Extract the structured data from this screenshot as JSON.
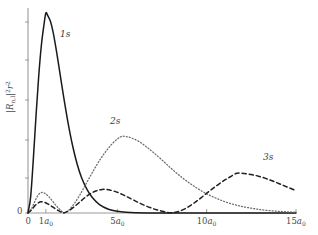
{
  "figure": {
    "title": "",
    "background_color": "#ffffff",
    "axis_color": "#9a9a9a",
    "text_color": "#4a4a4a",
    "width": 318,
    "height": 235
  },
  "axes": {
    "ylabel_parts": {
      "R": "R",
      "nl": "n,l",
      "bars_open": "|",
      "bars_close": "|",
      "sq": "2",
      "r": "r",
      "r_exp": "2"
    },
    "ylabel_text": "|R n,l|² r²",
    "y_origin_label": "0",
    "x_origin_label": "0",
    "xticks": [
      {
        "value": 0,
        "label": "0",
        "unit": "",
        "sub": "",
        "x_px": 28
      },
      {
        "value": 1,
        "label": "1",
        "unit": "a",
        "sub": "0",
        "x_px": 46
      },
      {
        "value": 5,
        "label": "5",
        "unit": "a",
        "sub": "0",
        "x_px": 117
      },
      {
        "value": 10,
        "label": "10",
        "unit": "a",
        "sub": "0",
        "x_px": 206
      },
      {
        "value": 15,
        "label": "15",
        "unit": "a",
        "sub": "0",
        "x_px": 295
      }
    ],
    "yticks_px": [
      22,
      60,
      100,
      140,
      178,
      213
    ],
    "xlim": [
      0,
      15
    ],
    "ylim": [
      0,
      1.0
    ],
    "grid": false
  },
  "chart_data": {
    "type": "line",
    "title": "",
    "xlabel": "",
    "ylabel": "|R_{n,l}|^2 r^2",
    "xlim": [
      0,
      15
    ],
    "ylim": [
      0,
      1.0
    ],
    "x_unit": "a_0",
    "grid": false,
    "legend": "inline-annotations",
    "series": [
      {
        "name": "1s",
        "label": "1s",
        "style": "solid",
        "color": "#1a1a1a",
        "width": 1.5,
        "peak": {
          "x": 1.0,
          "y": 1.0
        },
        "points": [
          [
            0.0,
            0.0
          ],
          [
            0.15,
            0.082
          ],
          [
            0.3,
            0.272
          ],
          [
            0.45,
            0.487
          ],
          [
            0.6,
            0.685
          ],
          [
            0.75,
            0.84
          ],
          [
            0.9,
            0.945
          ],
          [
            1.0,
            1.0
          ],
          [
            1.1,
            0.988
          ],
          [
            1.25,
            0.96
          ],
          [
            1.4,
            0.907
          ],
          [
            1.6,
            0.806
          ],
          [
            1.8,
            0.692
          ],
          [
            2.0,
            0.578
          ],
          [
            2.25,
            0.447
          ],
          [
            2.5,
            0.335
          ],
          [
            2.75,
            0.245
          ],
          [
            3.0,
            0.176
          ],
          [
            3.3,
            0.118
          ],
          [
            3.6,
            0.077
          ],
          [
            4.0,
            0.042
          ],
          [
            4.5,
            0.019
          ],
          [
            5.0,
            0.0084
          ],
          [
            5.5,
            0.0036
          ],
          [
            6.0,
            0.0015
          ],
          [
            7.0,
            0.00025
          ],
          [
            8.0,
            4e-05
          ],
          [
            9.0,
            6e-06
          ],
          [
            10.0,
            1e-06
          ],
          [
            15.0,
            0.0
          ]
        ]
      },
      {
        "name": "2s",
        "label": "2s",
        "style": "dotted",
        "color": "#6e6e6e",
        "width": 1.3,
        "first_bump": {
          "x": 0.78,
          "y": 0.103
        },
        "node": {
          "x": 2.0,
          "y": 0.0
        },
        "peak": {
          "x": 5.24,
          "y": 0.383
        },
        "points": [
          [
            0.0,
            0.0
          ],
          [
            0.2,
            0.022
          ],
          [
            0.4,
            0.062
          ],
          [
            0.6,
            0.093
          ],
          [
            0.78,
            0.103
          ],
          [
            0.95,
            0.098
          ],
          [
            1.15,
            0.083
          ],
          [
            1.35,
            0.062
          ],
          [
            1.55,
            0.04
          ],
          [
            1.75,
            0.02
          ],
          [
            1.9,
            0.008
          ],
          [
            2.0,
            0.0
          ],
          [
            2.15,
            0.005
          ],
          [
            2.35,
            0.02
          ],
          [
            2.6,
            0.048
          ],
          [
            2.9,
            0.09
          ],
          [
            3.2,
            0.138
          ],
          [
            3.5,
            0.186
          ],
          [
            3.8,
            0.233
          ],
          [
            4.1,
            0.276
          ],
          [
            4.4,
            0.313
          ],
          [
            4.7,
            0.345
          ],
          [
            5.0,
            0.37
          ],
          [
            5.24,
            0.383
          ],
          [
            5.5,
            0.382
          ],
          [
            5.8,
            0.375
          ],
          [
            6.2,
            0.358
          ],
          [
            6.6,
            0.333
          ],
          [
            7.0,
            0.304
          ],
          [
            7.5,
            0.265
          ],
          [
            8.0,
            0.224
          ],
          [
            8.5,
            0.186
          ],
          [
            9.0,
            0.152
          ],
          [
            9.5,
            0.122
          ],
          [
            10.0,
            0.096
          ],
          [
            10.5,
            0.075
          ],
          [
            11.0,
            0.057
          ],
          [
            11.5,
            0.043
          ],
          [
            12.0,
            0.032
          ],
          [
            12.5,
            0.024
          ],
          [
            13.0,
            0.017
          ],
          [
            13.5,
            0.012
          ],
          [
            14.0,
            0.0085
          ],
          [
            14.5,
            0.0058
          ],
          [
            15.0,
            0.004
          ]
        ]
      },
      {
        "name": "3s",
        "label": "3s",
        "style": "dashed",
        "color": "#1f1f1f",
        "width": 1.5,
        "first_bump": {
          "x": 0.72,
          "y": 0.056
        },
        "second_bump": {
          "x": 4.15,
          "y": 0.118
        },
        "peak": {
          "x": 11.7,
          "y": 0.199
        },
        "points": [
          [
            0.0,
            0.0
          ],
          [
            0.2,
            0.016
          ],
          [
            0.4,
            0.038
          ],
          [
            0.6,
            0.052
          ],
          [
            0.72,
            0.056
          ],
          [
            0.9,
            0.054
          ],
          [
            1.1,
            0.046
          ],
          [
            1.3,
            0.035
          ],
          [
            1.5,
            0.023
          ],
          [
            1.7,
            0.012
          ],
          [
            1.85,
            0.005
          ],
          [
            1.95,
            0.001
          ],
          [
            2.05,
            0.002
          ],
          [
            2.3,
            0.012
          ],
          [
            2.6,
            0.032
          ],
          [
            2.9,
            0.055
          ],
          [
            3.2,
            0.078
          ],
          [
            3.5,
            0.097
          ],
          [
            3.8,
            0.11
          ],
          [
            4.15,
            0.118
          ],
          [
            4.5,
            0.116
          ],
          [
            4.9,
            0.107
          ],
          [
            5.3,
            0.092
          ],
          [
            5.7,
            0.074
          ],
          [
            6.1,
            0.056
          ],
          [
            6.5,
            0.039
          ],
          [
            6.9,
            0.025
          ],
          [
            7.2,
            0.016
          ],
          [
            7.5,
            0.009
          ],
          [
            7.75,
            0.004
          ],
          [
            7.95,
            0.001
          ],
          [
            8.15,
            0.002
          ],
          [
            8.5,
            0.01
          ],
          [
            8.9,
            0.027
          ],
          [
            9.3,
            0.05
          ],
          [
            9.7,
            0.077
          ],
          [
            10.1,
            0.106
          ],
          [
            10.5,
            0.133
          ],
          [
            10.9,
            0.158
          ],
          [
            11.3,
            0.18
          ],
          [
            11.7,
            0.199
          ],
          [
            12.1,
            0.197
          ],
          [
            12.5,
            0.192
          ],
          [
            12.9,
            0.184
          ],
          [
            13.3,
            0.173
          ],
          [
            13.7,
            0.16
          ],
          [
            14.1,
            0.145
          ],
          [
            14.5,
            0.13
          ],
          [
            15.0,
            0.112
          ]
        ]
      }
    ],
    "annotations": [
      {
        "text": "1s",
        "x_px": 60,
        "y_px": 30
      },
      {
        "text": "2s",
        "x_px": 110,
        "y_px": 117
      },
      {
        "text": "3s",
        "x_px": 263,
        "y_px": 153
      }
    ]
  }
}
